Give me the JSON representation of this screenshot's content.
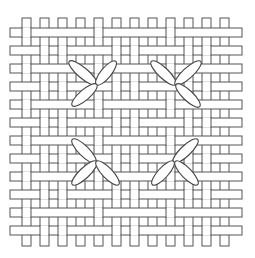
{
  "figure": {
    "title": "Cross stitches on woven basket-weave fabric"
  },
  "weave": {
    "vertical_count": 12,
    "horizontal_count": 12,
    "x0": 22,
    "y0": 28,
    "pitch": 18,
    "strip_width": 9,
    "vertical_y_start": 18,
    "vertical_y_end": 246,
    "horizontal_x_start": 10,
    "horizontal_x_end": 242,
    "stroke_color": "#555555",
    "fill_color": "#ffffff"
  },
  "stitches": [
    {
      "id": "top-left",
      "petals": [
        [
          70,
          62,
          96,
          84
        ],
        [
          115,
          62,
          97,
          84
        ],
        [
          96,
          85,
          73,
          105
        ]
      ]
    },
    {
      "id": "top-right",
      "petals": [
        [
          152,
          62,
          175,
          84
        ],
        [
          200,
          62,
          176,
          84
        ],
        [
          177,
          85,
          199,
          106
        ]
      ]
    },
    {
      "id": "bottom-left",
      "petals": [
        [
          73,
          140,
          95,
          162
        ],
        [
          96,
          162,
          73,
          184
        ],
        [
          97,
          162,
          118,
          184
        ]
      ]
    },
    {
      "id": "bottom-right",
      "petals": [
        [
          197,
          140,
          174,
          162
        ],
        [
          173,
          162,
          153,
          184
        ],
        [
          176,
          162,
          197,
          184
        ]
      ]
    }
  ],
  "stitch_colors": {
    "fill": "#ffffff",
    "stroke": "#444444"
  }
}
